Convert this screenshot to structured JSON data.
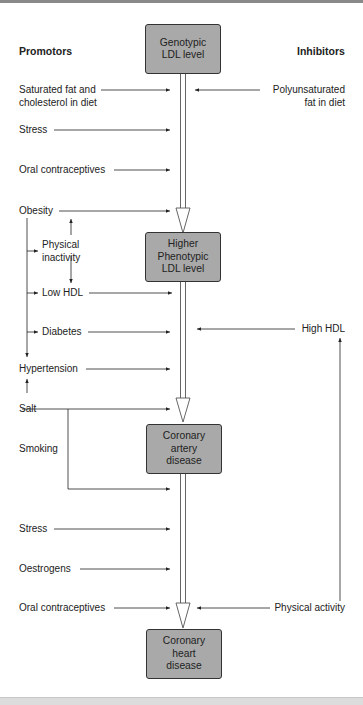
{
  "headers": {
    "promotors": "Promotors",
    "inhibitors": "Inhibitors"
  },
  "boxes": {
    "genotypic": "Genotypic\nLDL level",
    "phenotypic": "Higher\nPhenotypic\nLDL level",
    "cad": "Coronary\nartery\ndisease",
    "chd": "Coronary\nheart\ndisease"
  },
  "promotors": {
    "sat_fat_1": "Saturated fat and",
    "sat_fat_2": "cholesterol in diet",
    "stress1": "Stress",
    "oral1": "Oral contraceptives",
    "obesity": "Obesity",
    "phys_inact_1": "Physical",
    "phys_inact_2": "inactivity",
    "low_hdl": "Low HDL",
    "diabetes": "Diabetes",
    "hypertension": "Hypertension",
    "salt": "Salt",
    "smoking": "Smoking",
    "stress2": "Stress",
    "oestrogens": "Oestrogens",
    "oral2": "Oral contraceptives"
  },
  "inhibitors": {
    "polyunsat_1": "Polyunsaturated",
    "polyunsat_2": "fat in diet",
    "high_hdl": "High HDL",
    "physical_activity": "Physical activity"
  },
  "colors": {
    "box_fill": "#a9a9a9",
    "box_border": "#333333",
    "line": "#222222"
  }
}
